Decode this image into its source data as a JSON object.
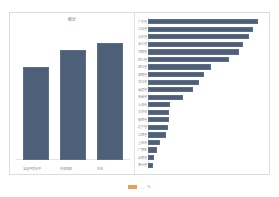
{
  "chart_data": [
    {
      "id": "left-vertical",
      "type": "bar",
      "orientation": "vertical",
      "title": "统计",
      "categories": [
        "全国平均水平",
        "东部地区",
        "本市"
      ],
      "values": [
        70,
        83,
        88
      ],
      "xlabel": "",
      "ylabel": "",
      "ylim": [
        0,
        100
      ],
      "grid": false,
      "legend": "none",
      "series_color": "#4e5f79"
    },
    {
      "id": "right-horizontal",
      "type": "bar",
      "orientation": "horizontal",
      "title": "",
      "categories": [
        "广东省",
        "江苏省",
        "山东省",
        "浙江省",
        "河南省",
        "四川省",
        "湖北省",
        "湖南省",
        "河北省",
        "福建省",
        "安徽省",
        "上海市",
        "北京市",
        "陕西省",
        "辽宁省",
        "江西省",
        "重庆市",
        "广西区",
        "云南省",
        "贵州省"
      ],
      "values": [
        96,
        91,
        88,
        83,
        79,
        70,
        55,
        49,
        44,
        39,
        30,
        19,
        18,
        18,
        17,
        16,
        10,
        8,
        5,
        4
      ],
      "xlabel": "",
      "ylabel": "",
      "xlim": [
        0,
        100
      ],
      "grid": false,
      "legend": "none",
      "series_color": "#4e5f79"
    }
  ],
  "footer": {
    "legend_label": "数据来源",
    "legend_separator": "—",
    "legend_unit": "%",
    "legend_color": "#e8a05c"
  }
}
